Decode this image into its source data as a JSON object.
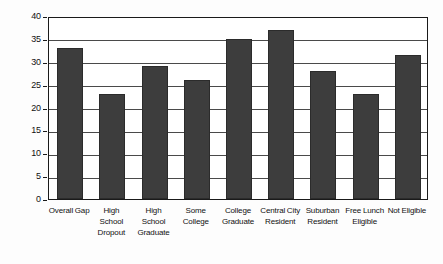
{
  "chart_data": {
    "type": "bar",
    "title": "",
    "xlabel": "",
    "ylabel": "",
    "ylim": [
      0,
      40
    ],
    "yticks": [
      0,
      5,
      10,
      15,
      20,
      25,
      30,
      35,
      40
    ],
    "grid": true,
    "legend": "none",
    "bar_color": "#3d3d3d",
    "categories": [
      "Overall Gap",
      "High School Dropout",
      "High School Graduate",
      "Some College",
      "College Graduate",
      "Central City Resident",
      "Suburban Resident",
      "Free Lunch Eligible",
      "Not Eligible"
    ],
    "category_lines": [
      [
        "Overall Gap"
      ],
      [
        "High",
        "School",
        "Dropout"
      ],
      [
        "High",
        "School",
        "Graduate"
      ],
      [
        "Some",
        "College"
      ],
      [
        "College",
        "Graduate"
      ],
      [
        "Central City",
        "Resident"
      ],
      [
        "Suburban",
        "Resident"
      ],
      [
        "Free Lunch",
        "Eligible"
      ],
      [
        "Not Eligible"
      ]
    ],
    "values": [
      33,
      23,
      29,
      26,
      35,
      37,
      28,
      23,
      31.5
    ]
  }
}
